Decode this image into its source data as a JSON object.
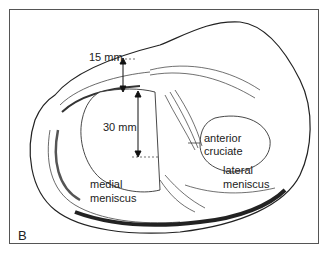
{
  "figure": {
    "panel_label": "B",
    "labels": {
      "dim_top": "15 mm",
      "dim_mid": "30 mm",
      "acl_line1": "anterior",
      "acl_line2": "cruciate",
      "medial_line1": "medial",
      "medial_line2": "meniscus",
      "lateral_line1": "lateral",
      "lateral_line2": "meniscus"
    },
    "colors": {
      "line": "#222222",
      "frame": "#555555",
      "background": "#ffffff"
    }
  }
}
